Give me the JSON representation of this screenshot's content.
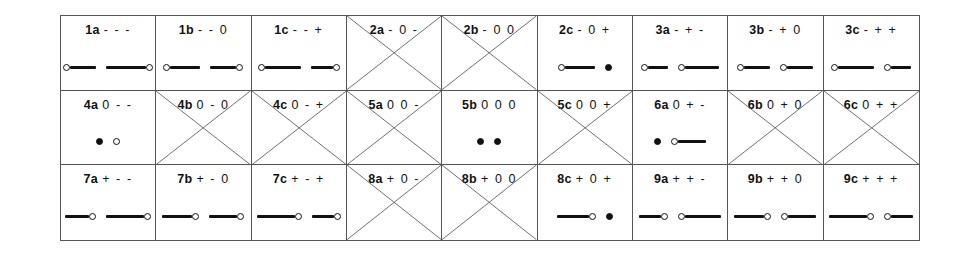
{
  "figure": {
    "columns": 9,
    "rows": 3,
    "border_color": "#555555",
    "ink_color": "#111111",
    "background": "#ffffff"
  },
  "cells": [
    {
      "code": "1a",
      "signs": "- - -",
      "crossed": false,
      "glyphs": [
        {
          "type": "segment",
          "left_endpoint": "open",
          "right_endpoint": "none",
          "length": 26
        },
        {
          "type": "segment",
          "left_endpoint": "none",
          "right_endpoint": "open",
          "length": 40
        }
      ]
    },
    {
      "code": "1b",
      "signs": "- - 0",
      "crossed": false,
      "glyphs": [
        {
          "type": "segment",
          "left_endpoint": "open",
          "right_endpoint": "none",
          "length": 30
        },
        {
          "type": "segment",
          "left_endpoint": "none",
          "right_endpoint": "open",
          "length": 26
        }
      ]
    },
    {
      "code": "1c",
      "signs": "- - +",
      "crossed": false,
      "glyphs": [
        {
          "type": "segment",
          "left_endpoint": "open",
          "right_endpoint": "none",
          "length": 36
        },
        {
          "type": "segment",
          "left_endpoint": "none",
          "right_endpoint": "open",
          "length": 22
        }
      ]
    },
    {
      "code": "2a",
      "signs": "- 0 -",
      "crossed": true,
      "glyphs": []
    },
    {
      "code": "2b",
      "signs": "- 0 0",
      "crossed": true,
      "glyphs": []
    },
    {
      "code": "2c",
      "signs": "- 0 +",
      "crossed": false,
      "glyphs": [
        {
          "type": "segment",
          "left_endpoint": "open",
          "right_endpoint": "none",
          "length": 30
        },
        {
          "type": "point",
          "fill": "filled"
        }
      ]
    },
    {
      "code": "3a",
      "signs": "- + -",
      "crossed": false,
      "glyphs": [
        {
          "type": "segment",
          "left_endpoint": "open",
          "right_endpoint": "none",
          "length": 20
        },
        {
          "type": "segment",
          "left_endpoint": "open",
          "right_endpoint": "none",
          "length": 34
        }
      ]
    },
    {
      "code": "3b",
      "signs": "- + 0",
      "crossed": false,
      "glyphs": [
        {
          "type": "segment",
          "left_endpoint": "open",
          "right_endpoint": "none",
          "length": 26
        },
        {
          "type": "segment",
          "left_endpoint": "open",
          "right_endpoint": "none",
          "length": 26
        }
      ]
    },
    {
      "code": "3c",
      "signs": "- + +",
      "crossed": false,
      "glyphs": [
        {
          "type": "segment",
          "left_endpoint": "open",
          "right_endpoint": "none",
          "length": 36
        },
        {
          "type": "segment",
          "left_endpoint": "open",
          "right_endpoint": "none",
          "length": 20
        }
      ]
    },
    {
      "code": "4a",
      "signs": "0 - -",
      "crossed": false,
      "glyphs": [
        {
          "type": "point",
          "fill": "filled"
        },
        {
          "type": "point",
          "fill": "open"
        }
      ]
    },
    {
      "code": "4b",
      "signs": "0 - 0",
      "crossed": true,
      "glyphs": []
    },
    {
      "code": "4c",
      "signs": "0 - +",
      "crossed": true,
      "glyphs": []
    },
    {
      "code": "5a",
      "signs": "0 0 -",
      "crossed": true,
      "glyphs": []
    },
    {
      "code": "5b",
      "signs": "0 0 0",
      "crossed": false,
      "glyphs": [
        {
          "type": "point",
          "fill": "filled"
        },
        {
          "type": "point",
          "fill": "filled"
        }
      ]
    },
    {
      "code": "5c",
      "signs": "0 0 +",
      "crossed": true,
      "glyphs": []
    },
    {
      "code": "6a",
      "signs": "0 + -",
      "crossed": false,
      "glyphs": [
        {
          "type": "point",
          "fill": "filled"
        },
        {
          "type": "segment",
          "left_endpoint": "open",
          "right_endpoint": "none",
          "length": 28
        }
      ]
    },
    {
      "code": "6b",
      "signs": "0 + 0",
      "crossed": true,
      "glyphs": []
    },
    {
      "code": "6c",
      "signs": "0 + +",
      "crossed": true,
      "glyphs": []
    },
    {
      "code": "7a",
      "signs": "+ - -",
      "crossed": false,
      "glyphs": [
        {
          "type": "segment",
          "left_endpoint": "none",
          "right_endpoint": "open",
          "length": 24
        },
        {
          "type": "segment",
          "left_endpoint": "none",
          "right_endpoint": "open",
          "length": 38
        }
      ]
    },
    {
      "code": "7b",
      "signs": "+ - 0",
      "crossed": false,
      "glyphs": [
        {
          "type": "segment",
          "left_endpoint": "none",
          "right_endpoint": "open",
          "length": 30
        },
        {
          "type": "segment",
          "left_endpoint": "none",
          "right_endpoint": "open",
          "length": 28
        }
      ]
    },
    {
      "code": "7c",
      "signs": "+ - +",
      "crossed": false,
      "glyphs": [
        {
          "type": "segment",
          "left_endpoint": "none",
          "right_endpoint": "open",
          "length": 38
        },
        {
          "type": "segment",
          "left_endpoint": "none",
          "right_endpoint": "open",
          "length": 22
        }
      ]
    },
    {
      "code": "8a",
      "signs": "+ 0 -",
      "crossed": true,
      "glyphs": []
    },
    {
      "code": "8b",
      "signs": "+ 0 0",
      "crossed": true,
      "glyphs": []
    },
    {
      "code": "8c",
      "signs": "+ 0 +",
      "crossed": false,
      "glyphs": [
        {
          "type": "segment",
          "left_endpoint": "none",
          "right_endpoint": "open",
          "length": 32
        },
        {
          "type": "point",
          "fill": "filled"
        }
      ]
    },
    {
      "code": "9a",
      "signs": "+ + -",
      "crossed": false,
      "glyphs": [
        {
          "type": "segment",
          "left_endpoint": "none",
          "right_endpoint": "open",
          "length": 22
        },
        {
          "type": "segment",
          "left_endpoint": "open",
          "right_endpoint": "none",
          "length": 36
        }
      ]
    },
    {
      "code": "9b",
      "signs": "+ + 0",
      "crossed": false,
      "glyphs": [
        {
          "type": "segment",
          "left_endpoint": "none",
          "right_endpoint": "open",
          "length": 30
        },
        {
          "type": "segment",
          "left_endpoint": "open",
          "right_endpoint": "none",
          "length": 28
        }
      ]
    },
    {
      "code": "9c",
      "signs": "+ + +",
      "crossed": false,
      "glyphs": [
        {
          "type": "segment",
          "left_endpoint": "none",
          "right_endpoint": "open",
          "length": 38
        },
        {
          "type": "segment",
          "left_endpoint": "open",
          "right_endpoint": "none",
          "length": 22
        }
      ]
    }
  ]
}
